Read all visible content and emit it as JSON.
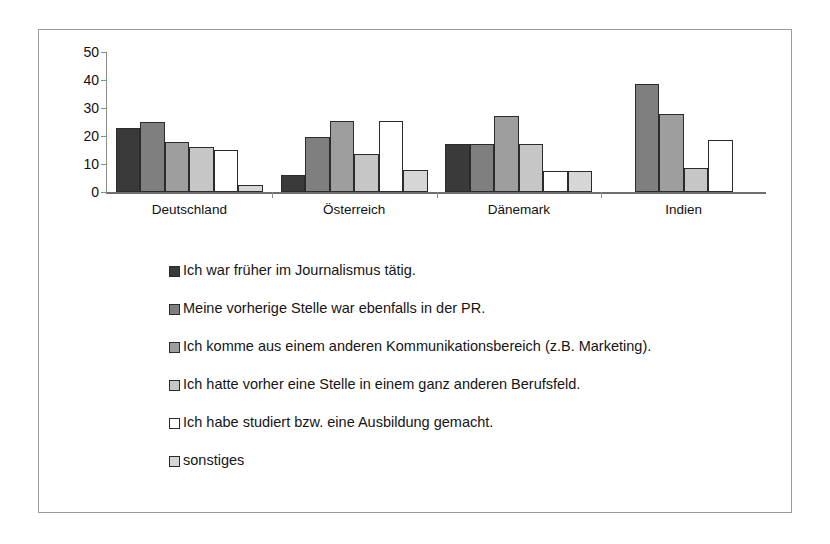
{
  "chart_data": {
    "type": "bar",
    "title": "",
    "subtitle": "",
    "xlabel": "",
    "ylabel": "",
    "ylim": [
      0,
      50
    ],
    "yticks": [
      0,
      10,
      20,
      30,
      40,
      50
    ],
    "ytick_labels": [
      "0",
      "10",
      "20",
      "30",
      "40",
      "50"
    ],
    "grid": false,
    "legend_position": "below",
    "categories": [
      "Deutschland",
      "Österreich",
      "Dänemark",
      "Indien"
    ],
    "series": [
      {
        "name": "Ich war früher im Journalismus tätig.",
        "color": "#3a3a3a",
        "values": [
          23,
          6,
          17,
          0
        ]
      },
      {
        "name": "Meine vorherige Stelle war ebenfalls in der PR.",
        "color": "#7f7f7f",
        "values": [
          25,
          19.5,
          17,
          38.5
        ]
      },
      {
        "name": "Ich komme aus einem anderen Kommunikationsbereich (z.B. Marketing).",
        "color": "#9e9e9e",
        "values": [
          18,
          25.5,
          27,
          28
        ]
      },
      {
        "name": "Ich hatte vorher eine Stelle in einem ganz anderen Berufsfeld.",
        "color": "#c6c6c6",
        "values": [
          16,
          13.5,
          17,
          8.5
        ]
      },
      {
        "name": "Ich habe studiert bzw. eine Ausbildung gemacht.",
        "color": "#ffffff",
        "values": [
          15,
          25.5,
          7.5,
          18.5
        ]
      },
      {
        "name": "sonstiges",
        "color": "#d6d6d6",
        "values": [
          2.5,
          8,
          7.5,
          0
        ]
      }
    ]
  },
  "colors": {
    "frame_border": "#9a9a9a",
    "axis": "#8d8d8d",
    "bar_outline": "#2b2b2b",
    "text": "#111111",
    "background": "#ffffff"
  }
}
